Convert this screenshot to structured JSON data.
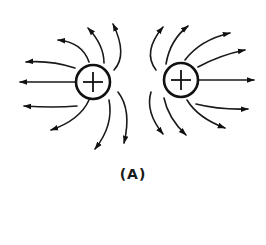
{
  "figure": {
    "caption": "(A)",
    "charges": [
      {
        "id": "left",
        "sign": "+",
        "symbol": "+",
        "cx": 93,
        "cy": 82,
        "r": 17
      },
      {
        "id": "right",
        "sign": "+",
        "symbol": "+",
        "cx": 181,
        "cy": 80,
        "r": 17
      }
    ],
    "colors": {
      "ink": "#111111",
      "background": "#ffffff"
    }
  }
}
